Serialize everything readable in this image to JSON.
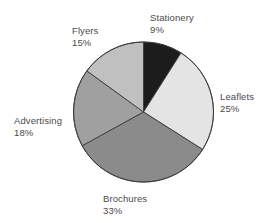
{
  "chart_data": {
    "type": "pie",
    "title": "",
    "subtitle": "",
    "xlabel": "",
    "ylabel": "",
    "legend_position": "none",
    "grid": false,
    "start_angle_deg": 0,
    "direction": "clockwise",
    "categories": [
      "Stationery",
      "Leaflets",
      "Brochures",
      "Advertising",
      "Flyers"
    ],
    "values": [
      9,
      25,
      33,
      18,
      15
    ],
    "value_unit": "%",
    "colors": [
      "#1c1c1c",
      "#e4e4e4",
      "#8b8b8b",
      "#a0a0a0",
      "#c0c0c0"
    ],
    "slices": [
      {
        "label": "Stationery",
        "value": 9,
        "value_text": "9%",
        "color": "#1c1c1c"
      },
      {
        "label": "Leaflets",
        "value": 25,
        "value_text": "25%",
        "color": "#e4e4e4"
      },
      {
        "label": "Brochures",
        "value": 33,
        "value_text": "33%",
        "color": "#8b8b8b"
      },
      {
        "label": "Advertising",
        "value": 18,
        "value_text": "18%",
        "color": "#a0a0a0"
      },
      {
        "label": "Flyers",
        "value": 15,
        "value_text": "15%",
        "color": "#c0c0c0"
      }
    ]
  },
  "labels": {
    "stationery": {
      "name": "Stationery",
      "value": "9%"
    },
    "leaflets": {
      "name": "Leaflets",
      "value": "25%"
    },
    "brochures": {
      "name": "Brochures",
      "value": "33%"
    },
    "advertising": {
      "name": "Advertising",
      "value": "18%"
    },
    "flyers": {
      "name": "Flyers",
      "value": "15%"
    }
  },
  "style": {
    "background_color": "#ffffff",
    "label_text_color": "#4a4a4a",
    "slice_border_color": "#3a3a3a"
  }
}
